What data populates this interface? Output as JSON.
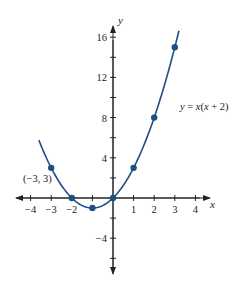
{
  "chart_data": {
    "type": "line",
    "title": "",
    "equation_label": "y = x(x + 2)",
    "xlabel": "x",
    "ylabel": "y",
    "xlim": [
      -4.6,
      4.7
    ],
    "ylim": [
      -7.4,
      17.2
    ],
    "x_ticks": [
      -4,
      -3,
      -2,
      -1,
      0,
      1,
      2,
      3,
      4
    ],
    "x_tick_labels": [
      "-4",
      "-3",
      "-2",
      "1",
      "2",
      "3",
      "4"
    ],
    "x_tick_label_values": [
      -4,
      -3,
      -2,
      1,
      2,
      3,
      4
    ],
    "y_ticks": [
      -6,
      -4,
      -2,
      2,
      4,
      6,
      8,
      10,
      12,
      14,
      16
    ],
    "y_tick_labels": [
      "-4",
      "4",
      "8",
      "12",
      "16"
    ],
    "y_tick_label_values": [
      -4,
      4,
      8,
      12,
      16
    ],
    "grid": false,
    "series": [
      {
        "name": "y = x(x + 2)",
        "color": "#1f4e86",
        "curve_x_range": [
          -3.6,
          3.2
        ],
        "points": [
          {
            "x": -3,
            "y": 3
          },
          {
            "x": -2,
            "y": 0
          },
          {
            "x": -1,
            "y": -1
          },
          {
            "x": 0,
            "y": 0
          },
          {
            "x": 1,
            "y": 3
          },
          {
            "x": 2,
            "y": 8
          },
          {
            "x": 3,
            "y": 15
          }
        ]
      }
    ],
    "annotations": [
      {
        "text": "(-3, 3)",
        "x": -3,
        "y": 3
      }
    ]
  },
  "labels": {
    "x_axis": "x",
    "y_axis": "y",
    "equation": "y = x(x + 2)",
    "point_annotation": "(−3, 3)",
    "x_ticks": [
      "−4",
      "−3",
      "−2",
      "1",
      "2",
      "3",
      "4"
    ],
    "y_ticks": [
      "16",
      "12",
      "8",
      "4",
      "−4"
    ]
  },
  "colors": {
    "curve": "#1f4e86",
    "axis": "#222222"
  }
}
